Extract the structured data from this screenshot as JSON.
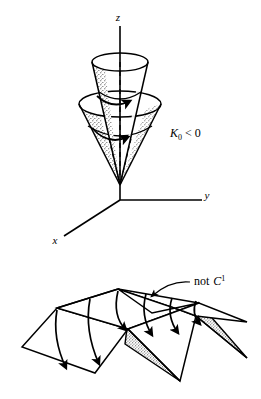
{
  "figure": {
    "background_color": "#ffffff",
    "ink_color": "#000000",
    "panels": [
      {
        "id": "cone-panel",
        "name": "nested-cones-with-axes",
        "label": "K_0 < 0"
      },
      {
        "id": "zigzag-panel",
        "name": "zigzag-accordion-surface",
        "label": "not C^1"
      }
    ]
  },
  "top_figure": {
    "axes": {
      "z_label": "z",
      "y_label": "y",
      "x_label": "x",
      "origin": {
        "x": 120,
        "y": 200
      }
    },
    "curvature_label": {
      "symbol": "K",
      "subscript": "0",
      "relation": "<",
      "value": "0",
      "full_text": "K0 < 0"
    },
    "cones": [
      {
        "name": "inner-cone",
        "rim_center_x": 120,
        "rim_center_y": 62,
        "rim_rx": 28,
        "rim_ry": 9
      },
      {
        "name": "outer-cone",
        "rim_center_x": 120,
        "rim_center_y": 104,
        "rim_rx": 41,
        "rim_ry": 13
      }
    ],
    "apex": {
      "x": 120,
      "y": 185
    },
    "shading": "stipple"
  },
  "bottom_figure": {
    "annotation": {
      "prefix": "not",
      "symbol": "C",
      "superscript": "1",
      "full_text": "not C1"
    },
    "surface": {
      "name": "pleated-zigzag-surface",
      "fold_count": 3,
      "shaded_end_faces": 2,
      "flow_lines": 6,
      "shading": "stipple"
    }
  },
  "colors": {
    "ink": "#000000",
    "paper": "#ffffff",
    "stipple": "#3a3a3a"
  }
}
